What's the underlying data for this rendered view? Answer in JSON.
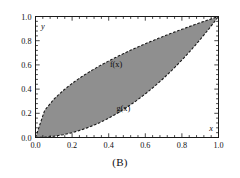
{
  "figure": {
    "caption": "(B)",
    "background_color": "#ffffff"
  },
  "chart_data": {
    "type": "area",
    "title": "",
    "subtitle": "",
    "caption": "(B)",
    "xlabel": "x",
    "ylabel": "y",
    "xlim": [
      0.0,
      1.0
    ],
    "ylim": [
      0.0,
      1.0
    ],
    "grid": false,
    "frame": "box",
    "legend_position": "inline-annotation",
    "xticks": [
      0.0,
      0.2,
      0.4,
      0.6,
      0.8,
      1.0
    ],
    "xticklabels": [
      "0.0",
      "0.2",
      "0.4",
      "0.6",
      "0.8",
      "1.0"
    ],
    "yticks": [
      0.0,
      0.2,
      0.4,
      0.6,
      0.8,
      1.0
    ],
    "yticklabels": [
      "0.0",
      "0.2",
      "0.4",
      "0.6",
      "0.8",
      "1.0"
    ],
    "minor_ticks_per_interval": 4,
    "fill": {
      "between": [
        "f(x)",
        "g(x)"
      ],
      "color": "#8f8f8f",
      "edge_color": "#1a1a1a",
      "edge_style": "dashed"
    },
    "annotations": [
      {
        "text": "f(x)",
        "x": 0.44,
        "y": 0.58
      },
      {
        "text": "g(x)",
        "x": 0.48,
        "y": 0.22
      }
    ],
    "x": [
      0.0,
      0.05,
      0.1,
      0.15,
      0.2,
      0.25,
      0.3,
      0.35,
      0.4,
      0.45,
      0.5,
      0.55,
      0.6,
      0.65,
      0.7,
      0.75,
      0.8,
      0.85,
      0.9,
      0.95,
      1.0
    ],
    "series": [
      {
        "name": "f(x)",
        "label": "f(x)",
        "expression": "sqrt(x)",
        "values": [
          0.0,
          0.224,
          0.316,
          0.387,
          0.447,
          0.5,
          0.548,
          0.592,
          0.632,
          0.671,
          0.707,
          0.742,
          0.775,
          0.806,
          0.837,
          0.866,
          0.894,
          0.922,
          0.949,
          0.975,
          1.0
        ]
      },
      {
        "name": "g(x)",
        "label": "g(x)",
        "expression": "x^2",
        "values": [
          0.0,
          0.0025,
          0.01,
          0.0225,
          0.04,
          0.0625,
          0.09,
          0.1225,
          0.16,
          0.2025,
          0.25,
          0.3025,
          0.36,
          0.4225,
          0.49,
          0.5625,
          0.64,
          0.7225,
          0.81,
          0.9025,
          1.0
        ]
      }
    ]
  }
}
